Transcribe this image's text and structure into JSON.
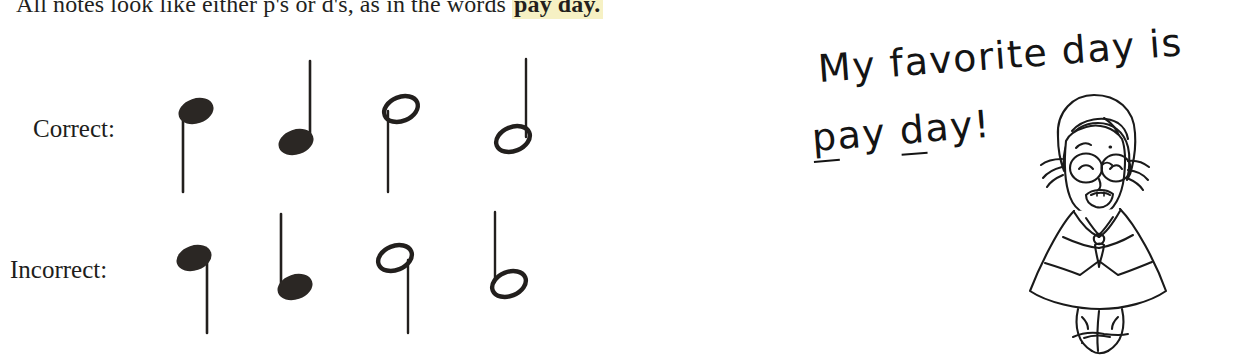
{
  "page": {
    "body_text": {
      "before": "All notes look like either p's or d's, as in the words ",
      "highlighted": "pay day.",
      "highlight_color": "#f6f1c4"
    },
    "ink_color": "#1c1a18"
  },
  "rows": [
    {
      "id": "correct",
      "label": "Correct:",
      "notes": [
        {
          "name": "filled-note-stem-down-left",
          "head": "filled",
          "stem": "down-left",
          "letter_shape": "p"
        },
        {
          "name": "filled-note-stem-up-right",
          "head": "filled",
          "stem": "up-right",
          "letter_shape": "d"
        },
        {
          "name": "hollow-note-stem-down-left",
          "head": "hollow",
          "stem": "down-left",
          "letter_shape": "p"
        },
        {
          "name": "hollow-note-stem-up-right",
          "head": "hollow",
          "stem": "up-right",
          "letter_shape": "d"
        }
      ]
    },
    {
      "id": "incorrect",
      "label": "Incorrect:",
      "notes": [
        {
          "name": "filled-note-stem-down-right",
          "head": "filled",
          "stem": "down-right",
          "letter_shape": "q"
        },
        {
          "name": "filled-note-stem-up-left",
          "head": "filled",
          "stem": "up-left",
          "letter_shape": "b"
        },
        {
          "name": "hollow-note-stem-down-right",
          "head": "hollow",
          "stem": "down-right",
          "letter_shape": "q"
        },
        {
          "name": "hollow-note-stem-up-left",
          "head": "hollow",
          "stem": "up-left",
          "letter_shape": "b"
        }
      ]
    }
  ],
  "annotation": {
    "line1": "My favorite day is",
    "line2_part1": "p",
    "line2_part2": "ay ",
    "line2_part3": "d",
    "line2_part4": "ay!",
    "full_text": "My favorite day is pay day!",
    "ink_color": "#141414"
  },
  "cartoon": {
    "description": "smiling cartoon woman with glasses, bobbed hair, necklace and A-line dress"
  }
}
